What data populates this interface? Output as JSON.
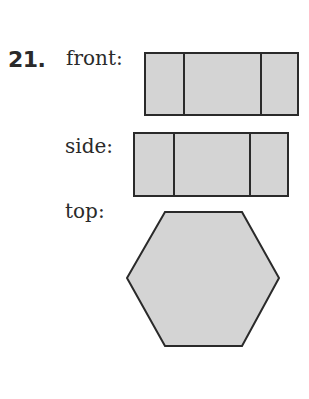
{
  "problem": {
    "number": "21.",
    "views": [
      {
        "label": "front:",
        "shape": "rectangle",
        "rect": {
          "x": 145,
          "y": 53,
          "w": 153,
          "h": 62
        },
        "dividers_x": [
          184,
          261
        ]
      },
      {
        "label": "side:",
        "shape": "rectangle",
        "rect": {
          "x": 134,
          "y": 133,
          "w": 154,
          "h": 63
        },
        "dividers_x": [
          174,
          250
        ]
      },
      {
        "label": "top:",
        "shape": "hexagon",
        "points": [
          [
            165,
            212
          ],
          [
            242,
            212
          ],
          [
            279,
            278
          ],
          [
            242,
            346
          ],
          [
            165,
            346
          ],
          [
            127,
            278
          ]
        ]
      }
    ]
  },
  "colors": {
    "fill": "#d4d4d4",
    "stroke": "#2a2a2a",
    "text": "#2a2a2a"
  }
}
